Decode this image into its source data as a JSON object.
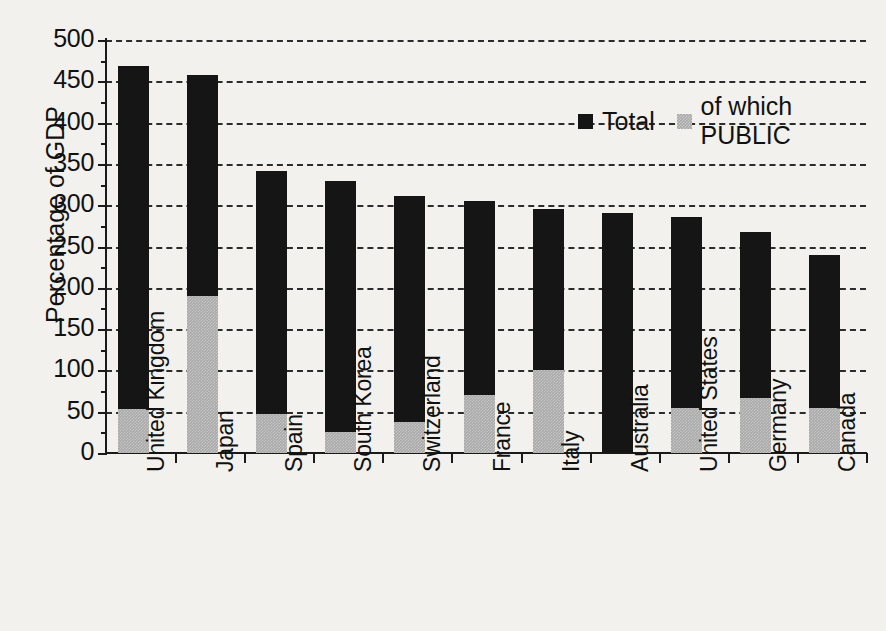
{
  "chart_data": {
    "type": "bar",
    "stacked": true,
    "title": "",
    "xlabel": "",
    "ylabel": "Percentage of GDP",
    "ylim": [
      0,
      500
    ],
    "ytick_step": 50,
    "ytick_labels": [
      "500",
      "450",
      "400",
      "350",
      "300",
      "250",
      "200",
      "150",
      "100",
      "50",
      "0"
    ],
    "grid": "horizontal dashed",
    "legend_position": "top-right",
    "categories": [
      "United Kingdom",
      "Japan",
      "Spain",
      "South Korea",
      "Switzerland",
      "France",
      "Italy",
      "Australia",
      "United States",
      "Germany",
      "Canada"
    ],
    "series": [
      {
        "name": "Total",
        "color": "#151515",
        "values": [
          468,
          458,
          342,
          329,
          311,
          305,
          296,
          291,
          286,
          268,
          240
        ]
      },
      {
        "name": "of which PUBLIC",
        "color": "#a9a9a9",
        "values": [
          53,
          190,
          47,
          26,
          37,
          70,
          100,
          0,
          55,
          66,
          55
        ]
      }
    ]
  },
  "legend": {
    "items": [
      {
        "label": "Total",
        "swatch": "total"
      },
      {
        "label": "of which PUBLIC",
        "swatch": "public"
      }
    ]
  }
}
